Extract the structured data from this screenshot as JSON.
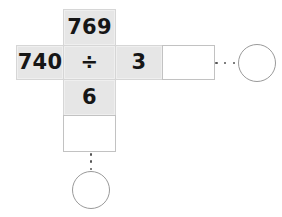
{
  "problem": {
    "type": "long-division-cross-layout",
    "dividend": "740",
    "operator": "÷",
    "divisor": "3",
    "product_above": "769",
    "product_below": "6",
    "quotient": "",
    "remainder": "",
    "quotient_answer_circle": "",
    "remainder_answer_circle": ""
  },
  "cells": {
    "top": {
      "label": "769",
      "filled": true
    },
    "left": {
      "label": "740",
      "filled": true
    },
    "operator": {
      "label": "÷",
      "filled": true
    },
    "divisor": {
      "label": "3",
      "filled": true
    },
    "answer": {
      "label": "",
      "filled": false
    },
    "below": {
      "label": "6",
      "filled": true
    },
    "remainder": {
      "label": "",
      "filled": false
    }
  },
  "connectors": {
    "horizontal_ellipsis": "⋯",
    "vertical_ellipsis": "⋮"
  },
  "circles": {
    "right": {
      "label": ""
    },
    "bottom": {
      "label": ""
    }
  },
  "colors": {
    "cell_fill": "#e6e6e6",
    "cell_border": "#d6d6d6",
    "blank_fill": "#ffffff",
    "blank_border": "#c2c2c2",
    "text": "#161616",
    "circle_stroke": "#9a9a9a",
    "dot": "#555555",
    "background": "#ffffff"
  }
}
